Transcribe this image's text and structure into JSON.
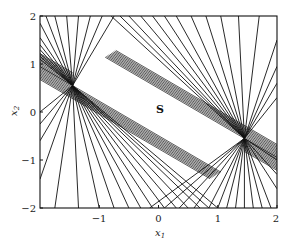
{
  "chart_data": {
    "type": "line",
    "title": "",
    "xlabel": "x1",
    "ylabel": "x2",
    "xlim": [
      -2,
      2
    ],
    "ylim": [
      -2,
      2
    ],
    "xticks": [
      -1,
      0,
      1,
      2
    ],
    "yticks": [
      2,
      1,
      0,
      -1,
      -2
    ],
    "grid": false,
    "legend": null,
    "annotations": [
      {
        "text": "S",
        "x": 0.0,
        "y": 0.1
      }
    ],
    "fan_centers": [
      {
        "name": "left",
        "x": -1.45,
        "y": 0.55
      },
      {
        "name": "right",
        "x": 1.45,
        "y": -0.55
      }
    ],
    "dense_band_slope": -0.72,
    "series": [
      {
        "name": "left-fan-upper-rays",
        "center": [
          -1.45,
          0.55
        ],
        "endpoints": [
          [
            -2,
            1.85
          ],
          [
            -2,
            1.55
          ],
          [
            -2,
            1.4
          ],
          [
            -2,
            1.3
          ],
          [
            -2,
            1.22
          ],
          [
            -2,
            1.16
          ],
          [
            -2,
            1.1
          ],
          [
            -1.9,
            2
          ],
          [
            -1.75,
            2
          ],
          [
            -1.55,
            2
          ],
          [
            -1.35,
            2
          ],
          [
            -1.15,
            2
          ],
          [
            -0.95,
            2
          ],
          [
            -0.75,
            2
          ]
        ]
      },
      {
        "name": "left-fan-lower-rays",
        "center": [
          -1.45,
          0.55
        ],
        "endpoints": [
          [
            -2,
            0.0
          ],
          [
            -2,
            -0.25
          ],
          [
            -2,
            -0.6
          ],
          [
            -2,
            -1.4
          ],
          [
            -1.75,
            -2
          ],
          [
            -1.35,
            -2
          ],
          [
            -1.0,
            -2
          ],
          [
            -0.75,
            -2
          ],
          [
            -0.5,
            -2
          ],
          [
            -0.3,
            -2
          ],
          [
            -0.1,
            -2
          ],
          [
            0.1,
            -2
          ],
          [
            0.3,
            -2
          ],
          [
            0.5,
            -2
          ],
          [
            0.7,
            -2
          ],
          [
            0.85,
            -2
          ],
          [
            1.0,
            -2
          ]
        ]
      },
      {
        "name": "right-fan-upper-rays",
        "center": [
          1.45,
          -0.55
        ],
        "endpoints": [
          [
            2,
            1.5
          ],
          [
            2,
            0.95
          ],
          [
            2,
            0.6
          ],
          [
            2,
            0.3
          ],
          [
            1.7,
            2
          ],
          [
            1.35,
            2
          ],
          [
            1.05,
            2
          ],
          [
            0.8,
            2
          ],
          [
            0.55,
            2
          ],
          [
            0.3,
            2
          ],
          [
            0.1,
            2
          ],
          [
            -0.1,
            2
          ],
          [
            -0.3,
            2
          ],
          [
            -0.5,
            2
          ],
          [
            -0.65,
            2
          ],
          [
            -0.8,
            2
          ]
        ]
      },
      {
        "name": "right-fan-lower-rays",
        "center": [
          1.45,
          -0.55
        ],
        "endpoints": [
          [
            2,
            -1.0
          ],
          [
            2,
            -1.3
          ],
          [
            2,
            -1.6
          ],
          [
            1.9,
            -2
          ],
          [
            1.75,
            -2
          ],
          [
            1.6,
            -2
          ],
          [
            1.45,
            -2
          ],
          [
            1.3,
            -2
          ],
          [
            1.15,
            -2
          ],
          [
            1.0,
            -2
          ],
          [
            0.85,
            -2
          ],
          [
            0.6,
            -2
          ],
          [
            0.35,
            -2
          ],
          [
            0.1,
            -2
          ],
          [
            -0.15,
            -2
          ]
        ]
      }
    ]
  },
  "labels": {
    "x_ticks": [
      "−1",
      "0",
      "1",
      "2"
    ],
    "y_ticks": [
      "2",
      "1",
      "0",
      "−1",
      "−2"
    ],
    "x_axis": "x",
    "x_axis_sub": "1",
    "y_axis": "x",
    "y_axis_sub": "2",
    "region": "S"
  }
}
